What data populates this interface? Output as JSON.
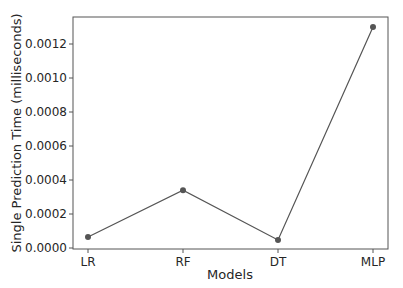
{
  "chart_data": {
    "type": "line",
    "title": "",
    "xlabel": "Models",
    "ylabel": "Single Prediction Time (milliseconds)",
    "categories": [
      "LR",
      "RF",
      "DT",
      "MLP"
    ],
    "series": [
      {
        "name": "Single Prediction Time",
        "values": [
          6.5e-05,
          0.00034,
          4.7e-05,
          0.0013
        ],
        "color": "#555555"
      }
    ],
    "yticks": [
      "0.0000",
      "0.0002",
      "0.0004",
      "0.0006",
      "0.0008",
      "0.0010",
      "0.0012"
    ],
    "ylim": [
      -3e-06,
      0.00136
    ],
    "grid": false,
    "legend": null
  }
}
